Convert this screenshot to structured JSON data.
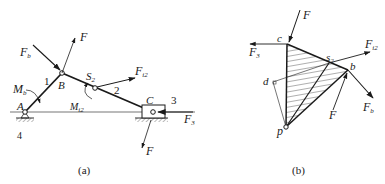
{
  "figure_a": {
    "caption": "(a)",
    "labels": {
      "F_top": "F",
      "Fb_main": "F",
      "Fb_sub": "b",
      "link1": "1",
      "B": "B",
      "S2_main": "S",
      "S2_sub": "2",
      "link2": "2",
      "Fi2_main": "F",
      "Fi2_sub": "i2",
      "C": "C",
      "link3": "3",
      "Mb_main": "M",
      "Mb_sub": "b",
      "A": "A",
      "Mi2_main": "M",
      "Mi2_sub": "i2",
      "ground4": "4",
      "F3_main": "F",
      "F3_sub": "3",
      "F_bottom": "F"
    }
  },
  "figure_b": {
    "caption": "(b)",
    "labels": {
      "F_top": "F",
      "c": "c",
      "F3_main": "F",
      "F3_sub": "3",
      "s2_main": "s",
      "s2_sub": "2",
      "Fi2_main": "F",
      "Fi2_sub": "i2",
      "b": "b",
      "d": "d",
      "Fb_main": "F",
      "Fb_sub": "b",
      "F_lower": "F",
      "p": "p"
    }
  },
  "colors": {
    "ink": "#1a1a1a",
    "background": "#ffffff"
  }
}
